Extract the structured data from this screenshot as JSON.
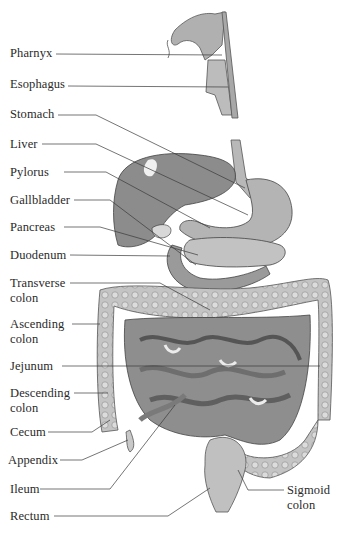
{
  "diagram": {
    "title": "",
    "labels": [
      {
        "id": "pharynx",
        "text": "Pharnyx",
        "x": 10,
        "y": 46
      },
      {
        "id": "esophagus",
        "text": "Esophagus",
        "x": 10,
        "y": 77
      },
      {
        "id": "stomach",
        "text": "Stomach",
        "x": 10,
        "y": 107
      },
      {
        "id": "liver",
        "text": "Liver",
        "x": 10,
        "y": 137
      },
      {
        "id": "pylorus",
        "text": "Pylorus",
        "x": 10,
        "y": 165
      },
      {
        "id": "gallbladder",
        "text": "Gallbladder",
        "x": 10,
        "y": 193
      },
      {
        "id": "pancreas",
        "text": "Pancreas",
        "x": 10,
        "y": 220
      },
      {
        "id": "duodenum",
        "text": "Duodenum",
        "x": 10,
        "y": 248
      },
      {
        "id": "transverse-colon",
        "text": "Transverse colon",
        "line1": "Transverse",
        "line2": "colon",
        "x": 10,
        "y": 276
      },
      {
        "id": "ascending-colon",
        "text": "Ascending colon",
        "line1": "Ascending",
        "line2": "colon",
        "x": 10,
        "y": 317
      },
      {
        "id": "jejunum",
        "text": "Jejunum",
        "x": 10,
        "y": 359
      },
      {
        "id": "descending-colon",
        "text": "Descending colon",
        "line1": "Descending",
        "line2": "colon",
        "x": 10,
        "y": 386
      },
      {
        "id": "cecum",
        "text": "Cecum",
        "x": 10,
        "y": 425
      },
      {
        "id": "appendix",
        "text": "Appendix",
        "x": 8,
        "y": 453
      },
      {
        "id": "ileum",
        "text": "Ileum",
        "x": 10,
        "y": 482
      },
      {
        "id": "rectum",
        "text": "Rectum",
        "x": 10,
        "y": 509
      },
      {
        "id": "sigmoid-colon",
        "text": "Sigmoid colon",
        "line1": "Sigmoid",
        "line2": "colon",
        "x": 287,
        "y": 483
      }
    ]
  },
  "labels": {
    "pharynx": "Pharnyx",
    "esophagus": "Esophagus",
    "stomach": "Stomach",
    "liver": "Liver",
    "pylorus": "Pylorus",
    "gallbladder": "Gallbladder",
    "pancreas": "Pancreas",
    "duodenum": "Duodenum",
    "transverse_1": "Transverse",
    "transverse_2": "colon",
    "ascending_1": "Ascending",
    "ascending_2": "colon",
    "jejunum": "Jejunum",
    "descending_1": "Descending",
    "descending_2": "colon",
    "cecum": "Cecum",
    "appendix": "Appendix",
    "ileum": "Ileum",
    "rectum": "Rectum",
    "sigmoid_1": "Sigmoid",
    "sigmoid_2": "colon"
  },
  "colors": {
    "organ_dark": "#8a8a8a",
    "organ_mid": "#a8a8a8",
    "organ_light": "#c8c8c8",
    "outline": "#444444",
    "text": "#2a2a2a"
  }
}
